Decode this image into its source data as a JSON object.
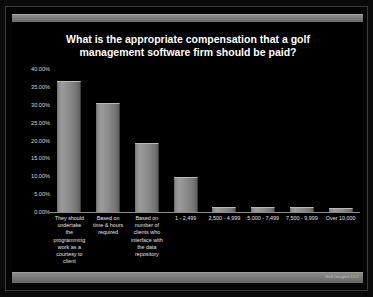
{
  "slide": {
    "watermark": "Golf Insights LLC"
  },
  "chart_data": {
    "type": "bar",
    "title": "What is the appropriate compensation that a golf management software firm should be paid?",
    "title_lines": [
      "What is the appropriate compensation that a golf",
      "management software firm should be paid?"
    ],
    "xlabel": "",
    "ylabel": "",
    "ylim": [
      0,
      40
    ],
    "grid": false,
    "legend": "none",
    "ytick_labels": [
      "40.00%",
      "35.00%",
      "30.00%",
      "25.00%",
      "20.00%",
      "15.00%",
      "10.00%",
      "5.00%",
      "0.00%"
    ],
    "ytick_values": [
      40,
      35,
      30,
      25,
      20,
      15,
      10,
      5,
      0
    ],
    "categories": [
      "They should undertake the programming work as a courtesy to client",
      "Based on time & hours required",
      "Based on number of clients who interface with the data repository",
      "1 - 2,499",
      "2,500 - 4,999",
      "5,000 - 7,499",
      "7,500 - 9,999",
      "Over 10,000"
    ],
    "category_display": [
      "They should\nundertake\nthe\nprogramming\nwork as a\ncourtesy to\nclient",
      "Based on\ntime & hours\nrequired",
      "Based on\nnumber of\nclients who\ninterface with\nthe data\nrepository",
      "1 - 2,499",
      "2,500 - 4,999",
      "5,000 - 7,499",
      "7,500 - 9,999",
      "Over 10,000"
    ],
    "values": [
      36.6,
      30.4,
      19.3,
      9.9,
      1.3,
      1.3,
      1.3,
      1.2
    ],
    "value_labels": [
      "36.60%",
      "30.40%",
      "19.30%",
      "9.90%",
      "1.30%",
      "1.30%",
      "1.30%",
      "1.20%"
    ],
    "bar_color": "#8d8d8d",
    "background_color": "#000000",
    "text_color": "#e2e2e2",
    "title_color": "#ffffff"
  }
}
